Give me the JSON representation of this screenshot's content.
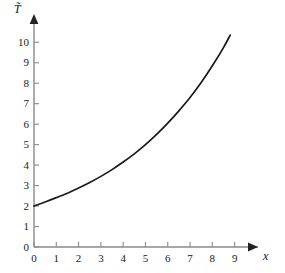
{
  "chart_data": {
    "type": "line",
    "title": "",
    "subtitle": "",
    "xlabel": "x",
    "ylabel": "T̃",
    "ylabel_plain": "T",
    "ylabel_accent": "tilde",
    "xlim": [
      0,
      9.6
    ],
    "ylim": [
      0,
      10.6
    ],
    "xticks": [
      0,
      1,
      2,
      3,
      4,
      5,
      6,
      7,
      8,
      9
    ],
    "xtick_labels": [
      "0",
      "1",
      "2",
      "3",
      "4",
      "5",
      "6",
      "7",
      "8",
      "9"
    ],
    "yticks": [
      0,
      1,
      2,
      3,
      4,
      5,
      6,
      7,
      8,
      9,
      10
    ],
    "ytick_labels": [
      "0",
      "1",
      "2",
      "3",
      "4",
      "5",
      "6",
      "7",
      "8",
      "9",
      "10"
    ],
    "grid": false,
    "legend": null,
    "legend_position": "none",
    "axis_arrows": true,
    "line_color": "#1a1a1a",
    "axis_color": "#808080",
    "series": [
      {
        "name": "T̃(x)",
        "x": [
          0.0,
          0.5,
          1.0,
          1.5,
          2.0,
          2.5,
          3.0,
          3.5,
          4.0,
          4.5,
          5.0,
          5.5,
          6.0,
          6.5,
          7.0,
          7.5,
          8.0,
          8.5,
          8.8
        ],
        "values": [
          2.0,
          2.2,
          2.41,
          2.63,
          2.88,
          3.15,
          3.45,
          3.78,
          4.15,
          4.55,
          5.0,
          5.5,
          6.05,
          6.65,
          7.3,
          8.03,
          8.85,
          9.74,
          10.35
        ]
      }
    ],
    "annotations": []
  },
  "figure": {
    "width": 285,
    "height": 273,
    "background": "#ffffff"
  }
}
